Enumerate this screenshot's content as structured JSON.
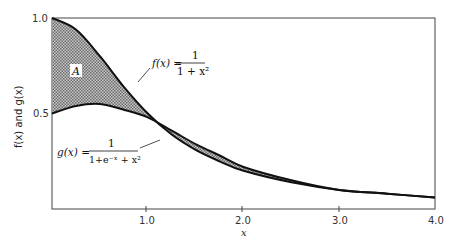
{
  "chart_data": {
    "type": "area",
    "title": "",
    "xlabel": "x",
    "ylabel": "f(x) and g(x)",
    "xlim": [
      0,
      4.0
    ],
    "ylim": [
      0,
      1.0
    ],
    "x_ticks": [
      "1.0",
      "2.0",
      "3.0",
      "4.0"
    ],
    "y_ticks": [
      "0.5",
      "1.0"
    ],
    "grid": false,
    "legend": "none (inline curve annotations)",
    "series": [
      {
        "name": "f(x) = 1/(1+x^2)",
        "label_lhs": "f(x) =",
        "label_num": "1",
        "label_den": "1 + x²",
        "x": [
          0,
          0.25,
          0.5,
          0.75,
          1.0,
          1.25,
          1.5,
          1.75,
          2.0,
          2.5,
          3.0,
          3.5,
          4.0
        ],
        "values": [
          1.0,
          0.94,
          0.8,
          0.64,
          0.5,
          0.39,
          0.31,
          0.25,
          0.2,
          0.14,
          0.1,
          0.08,
          0.06
        ]
      },
      {
        "name": "g(x) = 1/(1+e^-x+x^2)",
        "label_lhs": "g(x) =",
        "label_num": "1",
        "label_den": "1+e⁻ˣ + x²",
        "x": [
          0,
          0.25,
          0.5,
          0.75,
          1.0,
          1.25,
          1.5,
          1.75,
          2.0,
          2.5,
          3.0,
          3.5,
          4.0
        ],
        "values": [
          0.5,
          0.54,
          0.55,
          0.52,
          0.48,
          0.41,
          0.34,
          0.28,
          0.22,
          0.15,
          0.1,
          0.08,
          0.06
        ]
      }
    ],
    "annotations": [
      {
        "text": "A",
        "meaning": "shaded area between f(x) and g(x)"
      }
    ]
  },
  "labels": {
    "area": "A",
    "xlabel": "x",
    "ylabel": "f(x) and g(x)",
    "f_lhs": "f(x) =",
    "f_num": "1",
    "f_den": "1 + x²",
    "g_lhs": "g(x) =",
    "g_num": "1",
    "g_den": "1+e⁻ˣ + x²"
  }
}
